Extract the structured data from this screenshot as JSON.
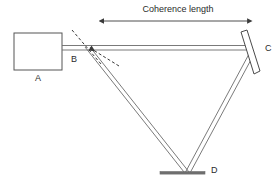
{
  "figure": {
    "title_label": "Coherence length",
    "background_color": "#ffffff",
    "line_color": "#4a4a4a",
    "beam_color": "#6b6b6b",
    "mirror_fill_color": "#6e6e6e",
    "text_color": "#2b2b2b"
  },
  "components": {
    "source": {
      "label": "A",
      "name": "laser-source-box"
    },
    "beamsplitter": {
      "label": "B",
      "name": "beam-splitter"
    },
    "mirror_right": {
      "label": "C",
      "name": "mirror-c"
    },
    "mirror_bottom": {
      "label": "D",
      "name": "mirror-d"
    }
  },
  "annotations": {
    "coherence_length": {
      "label": "Coherence length",
      "arrow_style": "double-headed",
      "span_start_x": 102,
      "span_end_x": 250,
      "y": 21
    }
  }
}
